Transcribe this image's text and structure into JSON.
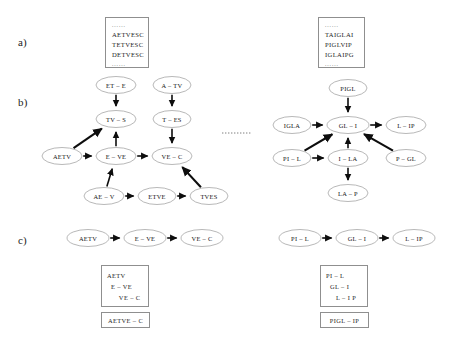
{
  "figure": {
    "panels": [
      {
        "id": "a",
        "label": "a)",
        "x": 18,
        "y": 36
      },
      {
        "id": "b",
        "label": "b)",
        "x": 18,
        "y": 96
      },
      {
        "id": "c",
        "label": "c)",
        "x": 18,
        "y": 234
      }
    ]
  },
  "panel_a": {
    "boxes": [
      {
        "name": "left-sequence-box",
        "x": 105,
        "y": 17,
        "w": 44,
        "h": 51,
        "dots_top": "......",
        "lines": [
          "AETVESC",
          "TETVESC",
          "DETVESC"
        ],
        "dots_bottom": "......"
      },
      {
        "name": "right-sequence-box",
        "x": 318,
        "y": 17,
        "w": 47,
        "h": 51,
        "dots_top": "......",
        "lines": [
          "TAIGLAI",
          "PIGLVIP",
          "IGLAIPG"
        ],
        "dots_bottom": "......"
      }
    ]
  },
  "panel_b": {
    "separator": {
      "name": "dotted-separator",
      "x1": 222,
      "y1": 133,
      "x2": 252,
      "y2": 133
    },
    "left_graph": {
      "name": "left-debruijn-graph",
      "nodes": [
        {
          "id": "bl1",
          "label": "ET – E",
          "cx": 116,
          "cy": 85,
          "rx": 20,
          "ry": 8.5
        },
        {
          "id": "bl2",
          "label": "A – TV",
          "cx": 172,
          "cy": 85,
          "rx": 19,
          "ry": 8.5
        },
        {
          "id": "bl3",
          "label": "TV – S",
          "cx": 116,
          "cy": 119,
          "rx": 20,
          "ry": 8.5
        },
        {
          "id": "bl4",
          "label": "T – ES",
          "cx": 172,
          "cy": 119,
          "rx": 19,
          "ry": 8.5
        },
        {
          "id": "bl5",
          "label": "AETV",
          "cx": 62,
          "cy": 156,
          "rx": 20,
          "ry": 8.5
        },
        {
          "id": "bl6",
          "label": "E – VE",
          "cx": 116,
          "cy": 156,
          "rx": 20,
          "ry": 8.5
        },
        {
          "id": "bl7",
          "label": "VE – C",
          "cx": 172,
          "cy": 156,
          "rx": 20,
          "ry": 8.5
        },
        {
          "id": "bl8",
          "label": "AE – V",
          "cx": 104,
          "cy": 196,
          "rx": 20,
          "ry": 8.5
        },
        {
          "id": "bl9",
          "label": "ETVE",
          "cx": 157,
          "cy": 196,
          "rx": 19,
          "ry": 8.5
        },
        {
          "id": "bl10",
          "label": "TVES",
          "cx": 209,
          "cy": 196,
          "rx": 19,
          "ry": 8.5
        }
      ],
      "edges": [
        {
          "from": "bl1",
          "to": "bl3",
          "kind": "straight"
        },
        {
          "from": "bl2",
          "to": "bl4",
          "kind": "straight"
        },
        {
          "from": "bl4",
          "to": "bl7",
          "kind": "straight"
        },
        {
          "from": "bl6",
          "to": "bl3",
          "kind": "straight"
        },
        {
          "from": "bl5",
          "to": "bl6",
          "kind": "straight"
        },
        {
          "from": "bl6",
          "to": "bl7",
          "kind": "straight"
        },
        {
          "from": "bl8",
          "to": "bl6",
          "kind": "straight"
        },
        {
          "from": "bl8",
          "to": "bl9",
          "kind": "straight"
        },
        {
          "from": "bl9",
          "to": "bl10",
          "kind": "straight"
        },
        {
          "from": "bl5",
          "to": "bl3",
          "kind": "diagonal"
        },
        {
          "from": "bl10",
          "to": "bl7",
          "kind": "diagonal"
        }
      ]
    },
    "right_graph": {
      "name": "right-debruijn-graph",
      "nodes": [
        {
          "id": "br1",
          "label": "PIGL",
          "cx": 348,
          "cy": 88,
          "rx": 19,
          "ry": 8.5
        },
        {
          "id": "br2",
          "label": "IGLA",
          "cx": 292,
          "cy": 125,
          "rx": 19,
          "ry": 8.5
        },
        {
          "id": "br3",
          "label": "GL – I",
          "cx": 348,
          "cy": 125,
          "rx": 21,
          "ry": 8.5
        },
        {
          "id": "br4",
          "label": "L – IP",
          "cx": 406,
          "cy": 125,
          "rx": 20,
          "ry": 8.5
        },
        {
          "id": "br5",
          "label": "PI – L",
          "cx": 292,
          "cy": 158,
          "rx": 19,
          "ry": 8.5
        },
        {
          "id": "br6",
          "label": "I – LA",
          "cx": 348,
          "cy": 158,
          "rx": 20,
          "ry": 8.5
        },
        {
          "id": "br7",
          "label": "P – GL",
          "cx": 406,
          "cy": 158,
          "rx": 20,
          "ry": 8.5
        },
        {
          "id": "br8",
          "label": "LA – P",
          "cx": 348,
          "cy": 193,
          "rx": 20,
          "ry": 8.5
        }
      ],
      "edges": [
        {
          "from": "br1",
          "to": "br3",
          "kind": "straight"
        },
        {
          "from": "br2",
          "to": "br3",
          "kind": "straight"
        },
        {
          "from": "br3",
          "to": "br4",
          "kind": "straight"
        },
        {
          "from": "br6",
          "to": "br3",
          "kind": "straight"
        },
        {
          "from": "br5",
          "to": "br6",
          "kind": "straight"
        },
        {
          "from": "br6",
          "to": "br8",
          "kind": "straight"
        },
        {
          "from": "br5",
          "to": "br3",
          "kind": "diagonal"
        },
        {
          "from": "br7",
          "to": "br3",
          "kind": "diagonal"
        }
      ]
    }
  },
  "panel_c": {
    "left_path": {
      "name": "left-path-chain",
      "nodes": [
        {
          "id": "cl1",
          "label": "AETV",
          "cx": 88,
          "cy": 238,
          "rx": 21,
          "ry": 8.5
        },
        {
          "id": "cl2",
          "label": "E – VE",
          "cx": 145,
          "cy": 238,
          "rx": 21,
          "ry": 8.5
        },
        {
          "id": "cl3",
          "label": "VE – C",
          "cx": 202,
          "cy": 238,
          "rx": 21,
          "ry": 8.5
        }
      ],
      "edges": [
        {
          "from": "cl1",
          "to": "cl2",
          "kind": "straight"
        },
        {
          "from": "cl2",
          "to": "cl3",
          "kind": "straight"
        }
      ],
      "stack_box": {
        "name": "left-overlap-stack",
        "x": 101,
        "y": 265,
        "w": 48,
        "h": 42,
        "lines": [
          "AETV",
          "  E – VE",
          "      VE – C"
        ]
      },
      "result_box": {
        "name": "left-assembly-result",
        "x": 101,
        "y": 312,
        "w": 49,
        "h": 16,
        "text": "AETVE – C"
      }
    },
    "right_path": {
      "name": "right-path-chain",
      "nodes": [
        {
          "id": "cr1",
          "label": "PI – L",
          "cx": 300,
          "cy": 238,
          "rx": 21,
          "ry": 8.5
        },
        {
          "id": "cr2",
          "label": "GL – I",
          "cx": 357,
          "cy": 238,
          "rx": 21,
          "ry": 8.5
        },
        {
          "id": "cr3",
          "label": "L – IP",
          "cx": 414,
          "cy": 238,
          "rx": 21,
          "ry": 8.5
        }
      ],
      "edges": [
        {
          "from": "cr1",
          "to": "cr2",
          "kind": "straight"
        },
        {
          "from": "cr2",
          "to": "cr3",
          "kind": "straight"
        }
      ],
      "stack_box": {
        "name": "right-overlap-stack",
        "x": 320,
        "y": 265,
        "w": 48,
        "h": 42,
        "lines": [
          "PI – L",
          "  GL – I",
          "     L – I P"
        ]
      },
      "result_box": {
        "name": "right-assembly-result",
        "x": 320,
        "y": 312,
        "w": 49,
        "h": 16,
        "text": "PIGL – IP"
      }
    }
  },
  "colors": {
    "node_stroke": "#9a9a9a",
    "edge": "#0d0d0d",
    "box_border": "#8f8f8f",
    "text": "#1a1a1a",
    "background": "#ffffff"
  }
}
